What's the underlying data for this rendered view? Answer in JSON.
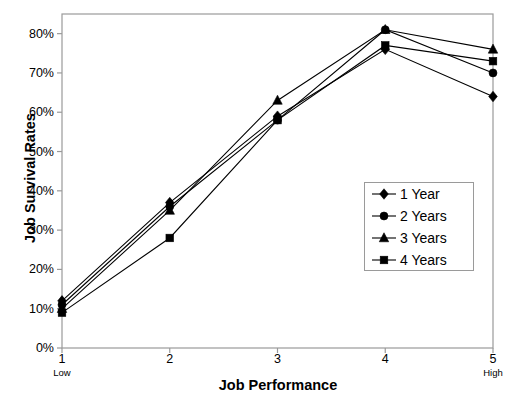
{
  "chart_data": {
    "type": "line",
    "title": "",
    "xlabel": "Job Performance",
    "ylabel": "Job Survival Rates",
    "x": [
      1,
      2,
      3,
      4,
      5
    ],
    "categories": [
      "1",
      "2",
      "3",
      "4",
      "5"
    ],
    "xtick_sublabels": [
      "Low",
      "",
      "",
      "",
      "High"
    ],
    "xlim": [
      1,
      5
    ],
    "ylim": [
      0,
      0.85
    ],
    "ytick_labels": [
      "0%",
      "10%",
      "20%",
      "30%",
      "40%",
      "50%",
      "60%",
      "70%",
      "80%"
    ],
    "ytick_values": [
      0,
      10,
      20,
      30,
      40,
      50,
      60,
      70,
      80
    ],
    "grid": false,
    "legend_position": "center-right",
    "series": [
      {
        "name": "1 Year",
        "marker": "diamond",
        "values": [
          12,
          37,
          59,
          76,
          64
        ]
      },
      {
        "name": "2 Years",
        "marker": "circle",
        "values": [
          11,
          36,
          58,
          81,
          70
        ]
      },
      {
        "name": "3 Years",
        "marker": "triangle",
        "values": [
          10,
          35,
          63,
          81,
          76
        ]
      },
      {
        "name": "4 Years",
        "marker": "square",
        "values": [
          9,
          28,
          58,
          77,
          73
        ]
      }
    ]
  },
  "legend": {
    "entries": [
      {
        "label": "1 Year"
      },
      {
        "label": "2 Years"
      },
      {
        "label": "3 Years"
      },
      {
        "label": "4 Years"
      }
    ]
  },
  "colors": {
    "line": "#000000",
    "frame": "#9a9a9a",
    "text": "#000000"
  }
}
